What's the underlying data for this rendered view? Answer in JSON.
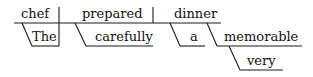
{
  "diagram": {
    "type": "reed-kellogg-sentence-diagram",
    "sentence_words": [
      "The",
      "chef",
      "carefully",
      "prepared",
      "a",
      "very",
      "memorable",
      "dinner"
    ],
    "subject": "chef",
    "verb": "prepared",
    "direct_object": "dinner",
    "modifiers": {
      "subject_modifier": "The",
      "verb_modifier": "carefully",
      "object_article": "a",
      "object_adjective": "memorable",
      "adjective_modifier": "very"
    }
  }
}
